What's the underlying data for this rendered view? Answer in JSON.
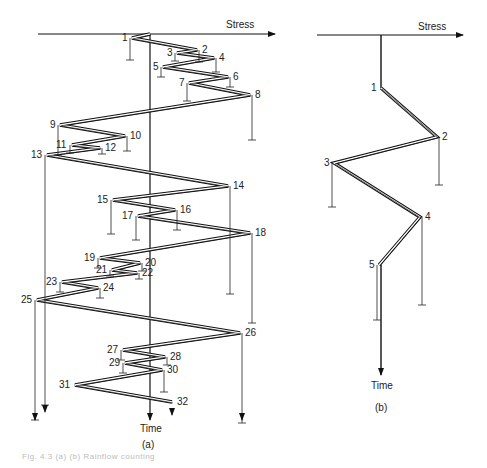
{
  "figure": {
    "panel_a": {
      "label": "(a)",
      "x_axis_label": "Stress",
      "y_axis_label": "Time",
      "reversals": [
        {
          "n": "1",
          "x": 132,
          "y": 38
        },
        {
          "n": "2",
          "x": 197,
          "y": 50
        },
        {
          "n": "3",
          "x": 177,
          "y": 53
        },
        {
          "n": "4",
          "x": 214,
          "y": 58
        },
        {
          "n": "5",
          "x": 163,
          "y": 67
        },
        {
          "n": "6",
          "x": 228,
          "y": 77
        },
        {
          "n": "7",
          "x": 189,
          "y": 83
        },
        {
          "n": "8",
          "x": 250,
          "y": 95
        },
        {
          "n": "9",
          "x": 60,
          "y": 125
        },
        {
          "n": "10",
          "x": 125,
          "y": 136
        },
        {
          "n": "11",
          "x": 72,
          "y": 145
        },
        {
          "n": "12",
          "x": 100,
          "y": 148
        },
        {
          "n": "13",
          "x": 47,
          "y": 155
        },
        {
          "n": "14",
          "x": 228,
          "y": 186
        },
        {
          "n": "15",
          "x": 113,
          "y": 200
        },
        {
          "n": "16",
          "x": 175,
          "y": 210
        },
        {
          "n": "17",
          "x": 138,
          "y": 216
        },
        {
          "n": "18",
          "x": 250,
          "y": 233
        },
        {
          "n": "19",
          "x": 100,
          "y": 258
        },
        {
          "n": "20",
          "x": 140,
          "y": 263
        },
        {
          "n": "21",
          "x": 112,
          "y": 270
        },
        {
          "n": "22",
          "x": 137,
          "y": 273
        },
        {
          "n": "23",
          "x": 62,
          "y": 282
        },
        {
          "n": "24",
          "x": 98,
          "y": 288
        },
        {
          "n": "25",
          "x": 37,
          "y": 300
        },
        {
          "n": "26",
          "x": 240,
          "y": 333
        },
        {
          "n": "27",
          "x": 123,
          "y": 350
        },
        {
          "n": "28",
          "x": 165,
          "y": 357
        },
        {
          "n": "29",
          "x": 125,
          "y": 363
        },
        {
          "n": "30",
          "x": 162,
          "y": 370
        },
        {
          "n": "31",
          "x": 75,
          "y": 385
        },
        {
          "n": "32",
          "x": 172,
          "y": 402
        }
      ]
    },
    "panel_b": {
      "label": "(b)",
      "x_axis_label": "Stress",
      "y_axis_label": "Time",
      "reversals": [
        {
          "n": "1",
          "x": 381,
          "y": 88
        },
        {
          "n": "2",
          "x": 437,
          "y": 137
        },
        {
          "n": "3",
          "x": 334,
          "y": 163
        },
        {
          "n": "4",
          "x": 420,
          "y": 217
        },
        {
          "n": "5",
          "x": 379,
          "y": 265
        }
      ]
    },
    "caption": "Fig. 4.3 (a) (b) Rainflow counting"
  }
}
